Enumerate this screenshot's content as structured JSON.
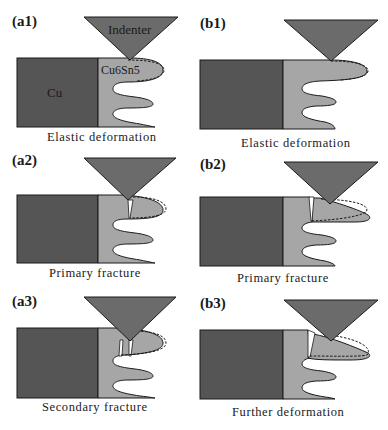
{
  "figure": {
    "panels": [
      {
        "id": "a1",
        "label": "(a1)",
        "caption": "Elastic deformation",
        "indenter_label": "Indenter",
        "substrate_label": "Cu",
        "imc_label": "Cu6Sn5"
      },
      {
        "id": "b1",
        "label": "(b1)",
        "caption": "Elastic deformation"
      },
      {
        "id": "a2",
        "label": "(a2)",
        "caption": "Primary fracture"
      },
      {
        "id": "b2",
        "label": "(b2)",
        "caption": "Primary fracture"
      },
      {
        "id": "a3",
        "label": "(a3)",
        "caption": "Secondary fracture"
      },
      {
        "id": "b3",
        "label": "(b3)",
        "caption": "Further deformation"
      }
    ],
    "colors": {
      "cu": "#555555",
      "imc": "#a6a6a6",
      "indenter": "#6b6b6b",
      "outline": "#1a1a1a"
    }
  }
}
